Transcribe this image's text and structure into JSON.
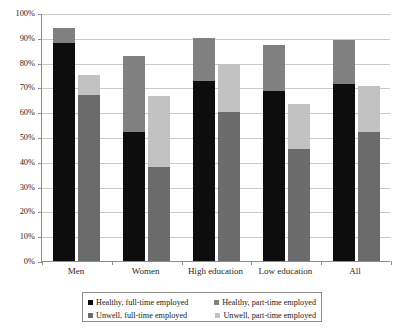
{
  "chart_data": {
    "type": "bar",
    "title": "",
    "subtitle": "",
    "xlabel": "",
    "ylabel": "",
    "ylim": [
      0,
      100
    ],
    "grid": true,
    "legend_position": "bottom",
    "stacked": true,
    "grouped": true,
    "bars_per_group": 2,
    "categories": [
      "Men",
      "Women",
      "High education",
      "Low education",
      "All"
    ],
    "ytick_labels": [
      "100%",
      "90%",
      "80%",
      "70%",
      "60%",
      "50%",
      "40%",
      "30%",
      "20%",
      "10%",
      "0%"
    ],
    "ytick_values": [
      100,
      90,
      80,
      70,
      60,
      50,
      40,
      30,
      20,
      10,
      0
    ],
    "series": [
      {
        "name": "Healthy, full-time employed",
        "color": "#0d0d0d",
        "bar_index": 0,
        "stack_index": 0,
        "values": [
          88,
          52,
          72.5,
          68.5,
          71.5
        ]
      },
      {
        "name": "Healthy, part-time employed",
        "color": "#808080",
        "bar_index": 0,
        "stack_index": 1,
        "values": [
          6,
          30.5,
          17.5,
          18.5,
          17.5
        ]
      },
      {
        "name": "Unwell, full-time employed",
        "color": "#6b6b6b",
        "bar_index": 1,
        "stack_index": 0,
        "values": [
          67,
          38,
          60,
          45,
          52
        ]
      },
      {
        "name": "Unwell, part-time employed",
        "color": "#c2c2c2",
        "bar_index": 1,
        "stack_index": 1,
        "values": [
          8,
          28.5,
          19.5,
          18.5,
          18.5
        ]
      }
    ],
    "stack_totals": {
      "healthy": [
        94,
        82.5,
        90,
        87,
        89
      ],
      "unwell": [
        75,
        66.5,
        79.5,
        63.5,
        70.5
      ]
    }
  },
  "legend": {
    "items": [
      {
        "label": "Healthy, full-time employed",
        "color": "#0d0d0d"
      },
      {
        "label": "Healthy, part-time employed",
        "color": "#808080"
      },
      {
        "label": "Unwell, full-time employed",
        "color": "#6b6b6b"
      },
      {
        "label": "Unwell, part-time employed",
        "color": "#c2c2c2"
      }
    ]
  },
  "colors": {
    "healthy_full_time": "#0d0d0d",
    "healthy_part_time": "#808080",
    "unwell_full_time": "#6b6b6b",
    "unwell_part_time": "#c2c2c2",
    "gridline": "#c9c9c9",
    "axis": "#8d8d8d",
    "background": "#ffffff"
  }
}
